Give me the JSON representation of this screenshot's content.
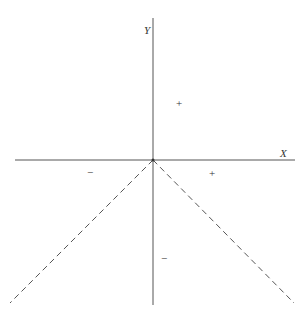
{
  "diagram": {
    "type": "coordinate-axes-sign-diagram",
    "colors": {
      "background": "#ffffff",
      "axis": "#555555",
      "dashed_line": "#555555",
      "text": "#333333"
    },
    "axes": {
      "x_label": "X",
      "y_label": "Y",
      "origin": [
        153,
        160
      ],
      "x_axis": {
        "from": [
          15,
          160
        ],
        "to": [
          295,
          160
        ]
      },
      "y_axis": {
        "from": [
          153,
          18
        ],
        "to": [
          153,
          305
        ]
      }
    },
    "dashed_lines": [
      {
        "name": "left-diagonal",
        "from": [
          153,
          160
        ],
        "to": [
          10,
          303
        ]
      },
      {
        "name": "right-diagonal",
        "from": [
          153,
          160
        ],
        "to": [
          294,
          303
        ]
      }
    ],
    "signs": [
      {
        "name": "upper-region",
        "text": "+",
        "x": 180,
        "y": 107
      },
      {
        "name": "left-region",
        "text": "−",
        "x": 91,
        "y": 176
      },
      {
        "name": "right-region",
        "text": "+",
        "x": 213,
        "y": 177
      },
      {
        "name": "lower-region",
        "text": "−",
        "x": 165,
        "y": 262
      }
    ]
  }
}
